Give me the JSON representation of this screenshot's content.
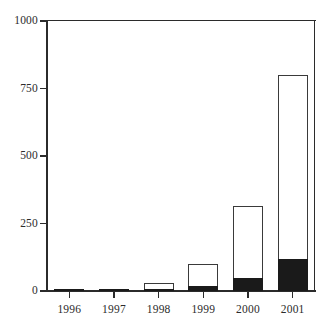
{
  "chart_data": {
    "type": "bar",
    "subtype": "stacked-bar",
    "title": "",
    "xlabel": "",
    "ylabel": "",
    "categories": [
      "1996",
      "1997",
      "1998",
      "1999",
      "2000",
      "2001"
    ],
    "series": [
      {
        "name": "filled-segment",
        "color": "#1a1a1a",
        "values": [
          2,
          1,
          4,
          18,
          48,
          118
        ]
      },
      {
        "name": "open-segment",
        "color": "#ffffff",
        "values": [
          3,
          2,
          26,
          82,
          267,
          682
        ]
      }
    ],
    "totals": [
      5,
      3,
      30,
      100,
      315,
      800
    ],
    "ylim": [
      0,
      1000
    ],
    "yticks": [
      0,
      250,
      500,
      750,
      1000
    ],
    "ytick_labels": [
      "0",
      "250",
      "500",
      "750",
      "1000"
    ],
    "grid": false,
    "legend": "none"
  },
  "axes": {
    "y": {
      "ticks": [
        {
          "label": "1000",
          "value": 1000
        },
        {
          "label": "750",
          "value": 750
        },
        {
          "label": "500",
          "value": 500
        },
        {
          "label": "250",
          "value": 250
        },
        {
          "label": "0",
          "value": 0
        }
      ]
    },
    "x": {
      "ticks": [
        {
          "label": "1996"
        },
        {
          "label": "1997"
        },
        {
          "label": "1998"
        },
        {
          "label": "1999"
        },
        {
          "label": "2000"
        },
        {
          "label": "2001"
        }
      ]
    }
  },
  "colors": {
    "axis": "#2b2b2b",
    "bar_outline": "#3a3a3a",
    "bar_fill_open": "#ffffff",
    "bar_fill_solid": "#1a1a1a",
    "background": "#ffffff"
  }
}
